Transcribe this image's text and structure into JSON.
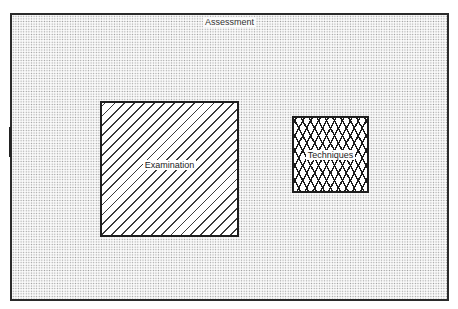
{
  "diagram": {
    "type": "nested-regions",
    "outer": {
      "label": "Assessment",
      "fill": "stipple"
    },
    "regions": [
      {
        "label": "Examination",
        "fill": "diagonal-hatch"
      },
      {
        "label": "Techniques",
        "fill": "cross-hatch"
      }
    ]
  }
}
